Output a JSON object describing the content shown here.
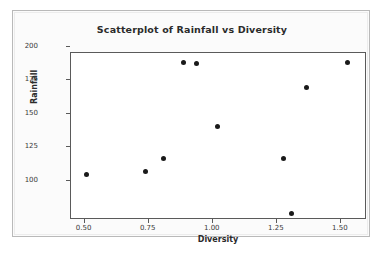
{
  "chart_data": {
    "type": "scatter",
    "title": "Scatterplot of Rainfall vs Diversity",
    "xlabel": "Diversity",
    "ylabel": "Rainfall",
    "xlim": [
      0.4,
      1.555
    ],
    "ylim": [
      78,
      203
    ],
    "grid": false,
    "legend": null,
    "xticks": [
      "0.50",
      "0.75",
      "1.00",
      "1.25",
      "1.50"
    ],
    "xtick_values": [
      0.5,
      0.75,
      1.0,
      1.25,
      1.5
    ],
    "yticks": [
      "100",
      "125",
      "150",
      "175",
      "200"
    ],
    "ytick_values": [
      100,
      125,
      150,
      175,
      200
    ],
    "marker": "filled-circle",
    "marker_color": "#1a1a1a",
    "series": [
      {
        "name": "Rainfall vs Diversity",
        "points": [
          {
            "x": 0.46,
            "y": 112
          },
          {
            "x": 0.69,
            "y": 114
          },
          {
            "x": 0.76,
            "y": 124
          },
          {
            "x": 0.84,
            "y": 196
          },
          {
            "x": 0.89,
            "y": 195
          },
          {
            "x": 0.97,
            "y": 148
          },
          {
            "x": 1.23,
            "y": 124
          },
          {
            "x": 1.26,
            "y": 83
          },
          {
            "x": 1.32,
            "y": 177
          },
          {
            "x": 1.48,
            "y": 196
          }
        ]
      }
    ]
  },
  "colors": {
    "plot_border": "#5a5a5a",
    "card_border": "#b9b9b9",
    "card_background": "#fbfbfb",
    "plot_background": "#ffffff",
    "text": "#2b2b2b",
    "tick_text": "#3a3a3a"
  }
}
